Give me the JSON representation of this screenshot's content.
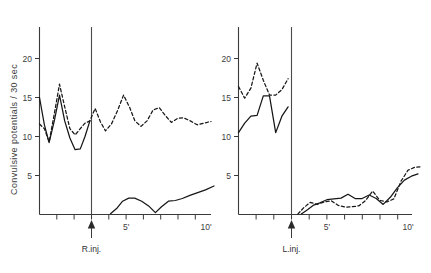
{
  "chart_data": {
    "type": "line",
    "title": "",
    "ylabel": "Convulsive potentials / 30 sec",
    "xlabel": "",
    "ylim": [
      0,
      24
    ],
    "y_ticks": [
      5,
      10,
      15,
      20
    ],
    "y_tick_labels": [
      "5",
      "10",
      "15",
      "20"
    ],
    "grid": false,
    "legend": "none",
    "panels": [
      {
        "name": "left-panel",
        "injection_label": "R.inj.",
        "injection_time": 3.0,
        "xlim": [
          0,
          10.6
        ],
        "x_ticks": [
          0,
          1,
          2,
          3,
          4,
          5,
          6,
          7,
          8,
          9,
          10
        ],
        "x_tick_labels": [
          "",
          "",
          "",
          "",
          "",
          "5'",
          "",
          "",
          "",
          "",
          "10'"
        ],
        "series": [
          {
            "name": "solid-upper-left",
            "style": "solid",
            "x": [
              0.0,
              0.28,
              0.55,
              0.85,
              1.15,
              1.45,
              1.75,
              2.05,
              2.35,
              2.62,
              2.9
            ],
            "values": [
              15.0,
              11.5,
              9.2,
              12.0,
              15.3,
              12.0,
              9.8,
              8.3,
              8.4,
              10.0,
              12.0
            ]
          },
          {
            "name": "dashed-upper-left",
            "style": "dashed",
            "x": [
              0.0,
              0.28,
              0.55,
              0.85,
              1.15,
              1.45,
              1.75,
              2.05,
              2.35,
              2.62,
              2.9,
              3.2,
              3.5,
              3.8,
              4.15,
              4.5,
              4.85,
              5.2,
              5.5,
              5.85,
              6.2,
              6.55,
              6.9,
              7.25,
              7.6,
              7.95,
              8.3,
              8.7,
              9.1,
              9.5,
              9.9,
              10.3
            ],
            "values": [
              11.6,
              11.0,
              9.3,
              12.9,
              16.7,
              13.8,
              11.0,
              10.2,
              11.0,
              11.7,
              12.0,
              13.6,
              11.9,
              10.7,
              11.6,
              13.3,
              15.3,
              13.6,
              12.0,
              11.3,
              12.0,
              13.4,
              13.7,
              12.7,
              11.8,
              12.3,
              12.4,
              12.0,
              11.5,
              11.7,
              11.9,
              11.9
            ]
          },
          {
            "name": "solid-lower-left",
            "style": "solid",
            "x": [
              4.1,
              4.45,
              4.8,
              5.15,
              5.5,
              5.9,
              6.3,
              6.7,
              7.05,
              7.45,
              7.85,
              8.25,
              8.7,
              9.15,
              9.6,
              10.1
            ],
            "values": [
              0.1,
              0.75,
              1.7,
              2.1,
              2.1,
              1.7,
              1.1,
              0.25,
              1.0,
              1.7,
              1.8,
              2.05,
              2.45,
              2.8,
              3.15,
              3.65
            ]
          }
        ]
      },
      {
        "name": "right-panel",
        "injection_label": "L.inj.",
        "injection_time": 3.0,
        "xlim": [
          0,
          10.6
        ],
        "x_ticks": [
          0,
          1,
          2,
          3,
          4,
          5,
          6,
          7,
          8,
          9,
          10
        ],
        "x_tick_labels": [
          "",
          "",
          "",
          "",
          "",
          "5'",
          "",
          "",
          "",
          "",
          "10'"
        ],
        "series": [
          {
            "name": "solid-upper-right",
            "style": "solid",
            "x": [
              0.0,
              0.35,
              0.7,
              1.05,
              1.4,
              1.75,
              2.1,
              2.45,
              2.8
            ],
            "values": [
              10.5,
              11.7,
              12.6,
              12.7,
              15.2,
              15.2,
              10.5,
              12.6,
              13.8
            ]
          },
          {
            "name": "dashed-upper-right",
            "style": "dashed",
            "x": [
              0.0,
              0.35,
              0.7,
              1.05,
              1.4,
              1.75,
              2.1,
              2.45,
              2.8
            ],
            "values": [
              16.4,
              14.9,
              16.2,
              19.4,
              17.2,
              15.3,
              15.3,
              16.0,
              17.4
            ]
          },
          {
            "name": "solid-lower-right",
            "style": "solid",
            "x": [
              3.55,
              3.9,
              4.25,
              4.6,
              5.0,
              5.4,
              5.8,
              6.2,
              6.6,
              7.0,
              7.4,
              7.8,
              8.2,
              8.6,
              9.0,
              9.4,
              9.8,
              10.2
            ],
            "values": [
              0.05,
              0.6,
              1.2,
              1.5,
              1.9,
              2.0,
              2.1,
              2.6,
              2.05,
              2.05,
              2.5,
              2.1,
              1.3,
              2.2,
              3.4,
              4.4,
              4.9,
              5.2
            ]
          },
          {
            "name": "dashed-lower-right",
            "style": "dashed",
            "x": [
              3.35,
              3.7,
              4.05,
              4.45,
              4.85,
              5.25,
              5.65,
              6.05,
              6.4,
              6.8,
              7.2,
              7.6,
              8.0,
              8.4,
              8.8,
              9.2,
              9.6,
              10.0,
              10.35
            ],
            "values": [
              0.05,
              0.9,
              1.55,
              1.3,
              1.6,
              1.75,
              1.15,
              0.95,
              1.0,
              1.1,
              1.9,
              3.0,
              1.9,
              1.7,
              2.1,
              4.3,
              5.6,
              6.0,
              6.05
            ]
          }
        ]
      }
    ]
  },
  "labels": {
    "y_axis_title": "Convulsive potentials / 30 sec",
    "y_axis_title_part1": "Convulsive potentials",
    "y_axis_title_sep": "/",
    "y_axis_title_part2": "30 sec",
    "y_5": "5",
    "y_10": "10",
    "y_15": "15",
    "y_20": "20",
    "left_x_5": "5'",
    "left_x_10": "10'",
    "right_x_5": "5'",
    "right_x_10": "10'",
    "left_injection": "R.inj.",
    "right_injection": "L.inj."
  },
  "colors": {
    "axis": "#3a3a3a",
    "series": "#161616",
    "text": "#3d3d3d",
    "background": "#ffffff"
  }
}
